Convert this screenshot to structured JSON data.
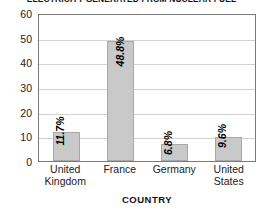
{
  "chart_data": {
    "type": "bar",
    "title": "ELECTRICITY GENERATED FROM NUCLEAR FUEL",
    "xlabel": "COUNTRY",
    "ylabel": "",
    "categories": [
      "United Kingdom",
      "France",
      "Germany",
      "United States"
    ],
    "category_lines": [
      [
        "United",
        "Kingdom"
      ],
      [
        "France"
      ],
      [
        "Germany"
      ],
      [
        "United",
        "States"
      ]
    ],
    "values": [
      11.7,
      48.8,
      6.8,
      9.6
    ],
    "data_labels": [
      "11.7%",
      "48.8%",
      "6.8%",
      "9.6%"
    ],
    "ylim": [
      0,
      60
    ],
    "yticks": [
      0,
      10,
      20,
      30,
      40,
      50,
      60
    ],
    "ytick_labels": [
      "0",
      "10",
      "20",
      "30",
      "40",
      "50",
      "60"
    ],
    "grid": true,
    "legend": false,
    "bar_color": "#c9c9c9",
    "bar_border_color": "#a8a8a8",
    "gridline_color": "#d2d2d2",
    "plot_border_color": "#7a7a7a",
    "label_color": "#000000",
    "label_rotation": -90
  }
}
